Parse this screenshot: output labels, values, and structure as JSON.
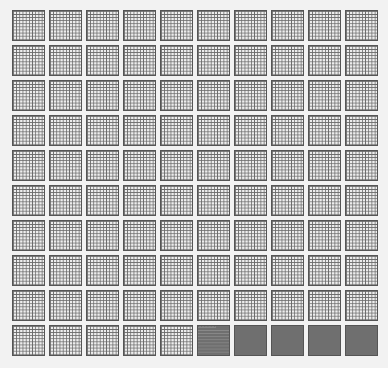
{
  "diagram": {
    "type": "hundred-grid-blocks",
    "blocks_rows": 10,
    "blocks_cols": 10,
    "cells_per_block": 100,
    "full_blocks": 4,
    "partial_block": {
      "index": 95,
      "filled_cells": 94
    },
    "colors": {
      "background": "#f2f2f2",
      "empty_cell": "#ededed",
      "grid_line": "#6a6a6a",
      "filled": "#6f6f6f"
    }
  }
}
